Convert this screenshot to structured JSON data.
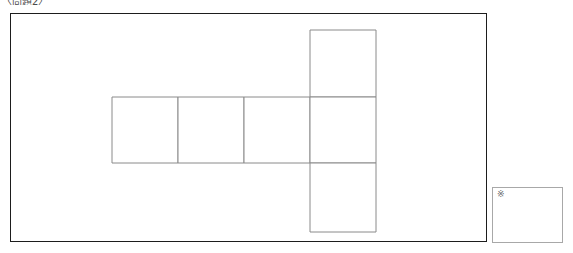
{
  "page": {
    "problem_label": "〈問題2〉",
    "background_color": "#ffffff"
  },
  "figure": {
    "frame": {
      "name": "figure-frame",
      "border_color": "#1d1d1d",
      "x": 10,
      "y": 13,
      "width": 477,
      "height": 229
    },
    "diagram_type": "cube-net",
    "line_color": "#8a8a8a",
    "cell_size": 66,
    "cells": [
      {
        "label": "row-square-1",
        "x": 101,
        "y": 83,
        "w": 66,
        "h": 66
      },
      {
        "label": "row-square-2",
        "x": 167,
        "y": 83,
        "w": 66,
        "h": 66
      },
      {
        "label": "row-square-3",
        "x": 233,
        "y": 83,
        "w": 66,
        "h": 66
      },
      {
        "label": "column-square-top",
        "x": 299,
        "y": 16,
        "w": 66,
        "h": 67
      },
      {
        "label": "column-square-middle",
        "x": 299,
        "y": 83,
        "w": 66,
        "h": 66
      },
      {
        "label": "column-square-bottom",
        "x": 299,
        "y": 149,
        "w": 66,
        "h": 69
      }
    ]
  },
  "answer_box": {
    "name": "answer-box",
    "mark": "※",
    "border_color": "#a8a8a8",
    "x": 492,
    "y": 187,
    "width": 71,
    "height": 56
  }
}
